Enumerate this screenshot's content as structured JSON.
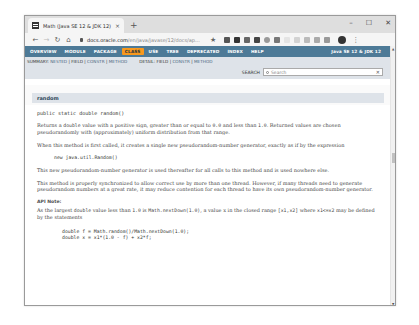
{
  "browser": {
    "tab": {
      "title": "Math (Java SE 12 & JDK 12)",
      "close": "×"
    },
    "new_tab": "+",
    "window_controls": {
      "minimize": "–",
      "maximize": "☐",
      "close": "✕"
    },
    "toolbar": {
      "back": "←",
      "forward": "→",
      "reload": "↻",
      "home": "⌂",
      "url_host": "docs.oracle.com",
      "url_path": "/en/java/javase/12/docs/ap...",
      "star": "★",
      "extension_colors": [
        "#555555",
        "#333333",
        "#666666",
        "#444444",
        "#999999",
        "#777777",
        "#dddddd",
        "#cccccc",
        "#bbbbbb",
        "#aaaaaa",
        "#999999"
      ],
      "menu": "⋮"
    }
  },
  "javadoc": {
    "topnav": {
      "items": [
        "OVERVIEW",
        "MODULE",
        "PACKAGE",
        "CLASS",
        "USE",
        "TREE",
        "DEPRECATED",
        "INDEX",
        "HELP"
      ],
      "active": "CLASS",
      "version": "Java SE 12 & JDK 12"
    },
    "subnav": {
      "summary_label": "SUMMARY:",
      "summary_items": [
        "NESTED",
        "FIELD",
        "CONSTR",
        "METHOD"
      ],
      "detail_label": "DETAIL:",
      "detail_items": [
        "FIELD",
        "CONSTR",
        "METHOD"
      ],
      "search_label": "SEARCH",
      "search_placeholder": "Search",
      "search_reset": "✕"
    },
    "member": {
      "name": "random",
      "signature": "public static double random()",
      "para1_a": "Returns a ",
      "para1_code1": "double",
      "para1_b": " value with a positive sign, greater than or equal to ",
      "para1_code2": "0.0",
      "para1_c": " and less than ",
      "para1_code3": "1.0",
      "para1_d": ". Returned values are chosen pseudorandomly with (approximately) uniform distribution from that range.",
      "para2": "When this method is first called, it creates a single new pseudorandom-number generator, exactly as if by the expression",
      "code1": "new java.util.Random()",
      "para3": "This new pseudorandom-number generator is used thereafter for all calls to this method and is used nowhere else.",
      "para4": "This method is properly synchronized to allow correct use by more than one thread. However, if many threads need to generate pseudorandom numbers at a great rate, it may reduce contention for each thread to have its own pseudorandom-number generator.",
      "api_note_label": "API Note:",
      "para5_a": "As the largest ",
      "para5_code1": "double",
      "para5_b": " value less than ",
      "para5_code2": "1.0",
      "para5_c": " is ",
      "para5_code3": "Math.nextDown(1.0)",
      "para5_d": ", a value ",
      "para5_e": "x",
      "para5_f": " in the closed range ",
      "para5_code4": "[x1,x2]",
      "para5_g": " where ",
      "para5_code5": "x1<=x2",
      "para5_h": " may be defined by the statements",
      "code2_line1": "double f = Math.random()/Math.nextDown(1.0);",
      "code2_line2": "double x = x1*(1.0 - f) + x2*f;"
    }
  }
}
